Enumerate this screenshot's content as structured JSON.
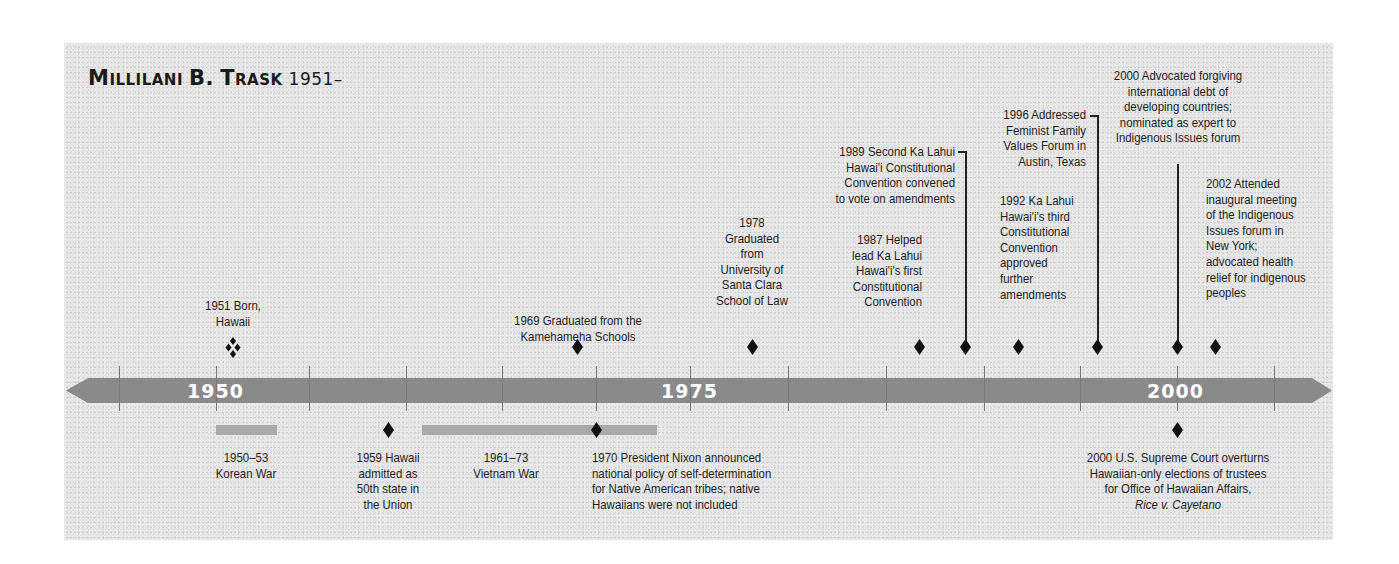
{
  "title": {
    "name_first": "M",
    "name_rest1": "ILLILANI",
    "name_b": "B.",
    "name_t": "T",
    "name_rest2": "RASK",
    "years": "1951–"
  },
  "axis": {
    "labels": [
      {
        "text": "1950",
        "year": 1950
      },
      {
        "text": "1975",
        "year": 1975
      },
      {
        "text": "2000",
        "year": 2000
      }
    ],
    "bar_color": "#8a8a8a",
    "tick_years": [
      1945,
      1950,
      1955,
      1960,
      1965,
      1970,
      1975,
      1980,
      1985,
      1990,
      1995,
      2000,
      2005
    ]
  },
  "events_above": [
    {
      "year": 1951,
      "lines": [
        "1951 Born,",
        "Hawaii"
      ],
      "marker": "diamond-cluster"
    },
    {
      "year": 1969,
      "lines": [
        "1969 Graduated from the",
        "Kamehameha Schools"
      ]
    },
    {
      "year": 1978,
      "lines": [
        "1978",
        "Graduated",
        "from",
        "University of",
        "Santa Clara",
        "School of Law"
      ]
    },
    {
      "year": 1987,
      "lines": [
        "1987 Helped",
        "lead Ka Lahui",
        "Hawai'i's first",
        "Constitutional",
        "Convention"
      ]
    },
    {
      "year": 1989,
      "lines": [
        "1989 Second Ka Lahui",
        "Hawai'i Constitutional",
        "Convention convened",
        "to vote on amendments"
      ]
    },
    {
      "year": 1992,
      "lines": [
        "1992 Ka Lahui",
        "Hawai'i's third",
        "Constitutional",
        "Convention",
        "approved",
        "further",
        "amendments"
      ]
    },
    {
      "year": 1996,
      "lines": [
        "1996 Addressed",
        "Feminist Family",
        "Values Forum in",
        "Austin, Texas"
      ]
    },
    {
      "year": 2000,
      "lines": [
        "2000 Advocated forgiving",
        "international debt of",
        "developing countries;",
        "nominated as expert to",
        "Indigenous Issues forum"
      ]
    },
    {
      "year": 2002,
      "lines": [
        "2002 Attended",
        "inaugural meeting",
        "of the Indigenous",
        "Issues forum in",
        "New York;",
        "advocated health",
        "relief for indigenous",
        "peoples"
      ]
    }
  ],
  "events_below": [
    {
      "span": "1950–1953",
      "lines": [
        "1950–53",
        "Korean War"
      ]
    },
    {
      "year": 1959,
      "lines": [
        "1959 Hawaii",
        "admitted as",
        "50th state in",
        "the Union"
      ]
    },
    {
      "span": "1961–1973",
      "lines": [
        "1961–73",
        "Vietnam War"
      ]
    },
    {
      "year": 1970,
      "lines": [
        "1970 President Nixon announced",
        "national policy of self-determination",
        "for Native American tribes; native",
        "Hawaiians were not included"
      ]
    },
    {
      "year": 2000,
      "lines": [
        "2000 U.S. Supreme Court overturns",
        "Hawaiian-only elections of trustees",
        "for Office of Hawaiian Affairs,"
      ],
      "case": "Rice v. Cayetano"
    }
  ]
}
